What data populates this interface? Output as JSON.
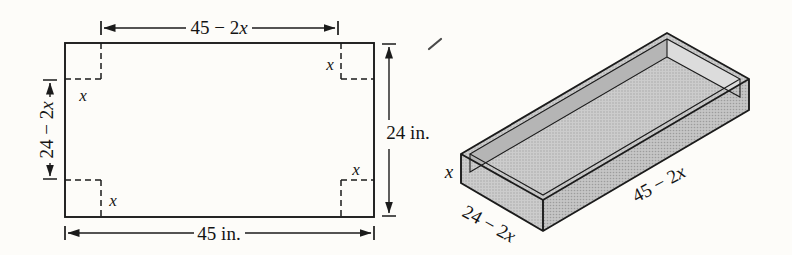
{
  "figure_title": "corner-cut sheet folded into open box",
  "colors": {
    "ink": "#1b1b1b",
    "paper": "#fdfcf9",
    "sheet_gray": "#c6c6c6",
    "front_face_gray": "#bfbfbf",
    "inner_shadow_gray": "#b5b5b5",
    "inner_highlight_gray": "#dcdcdc"
  },
  "flat_sheet": {
    "bottom_width_label": "45 in.",
    "right_height_label": "24 in.",
    "top_inner_dim": {
      "prefix": "45 − 2",
      "variable": "x"
    },
    "left_inner_dim": {
      "prefix": "24 − 2",
      "variable": "x"
    },
    "corner_cut": {
      "top_left": "x",
      "top_right": "x",
      "bottom_left": "x",
      "bottom_right": "x"
    }
  },
  "folded_box": {
    "depth_label": "x",
    "width_edge_dim": {
      "prefix": "24 − 2",
      "variable": "x"
    },
    "length_edge_dim": {
      "prefix": "45 − 2",
      "variable": "x"
    }
  }
}
